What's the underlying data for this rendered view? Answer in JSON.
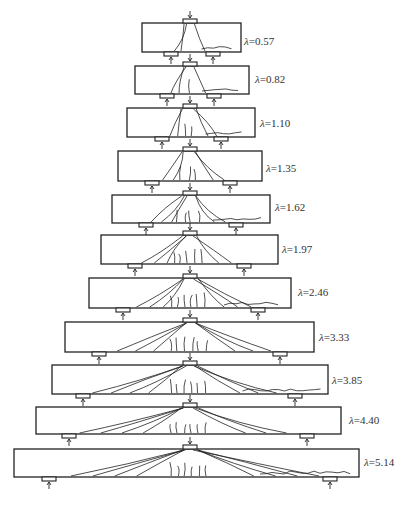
{
  "figure": {
    "symbol": "λ",
    "beams": [
      {
        "label": "=0.57",
        "x1": 142,
        "x2": 241,
        "top": 23,
        "bottom": 52,
        "sl": 171,
        "sr": 213,
        "lx": 244,
        "ly": 35
      },
      {
        "label": "=0.82",
        "x1": 135,
        "x2": 249,
        "top": 66,
        "bottom": 94,
        "sl": 167,
        "sr": 214,
        "lx": 255,
        "ly": 73
      },
      {
        "label": "=1.10",
        "x1": 127,
        "x2": 255,
        "top": 108,
        "bottom": 137,
        "sl": 162,
        "sr": 221,
        "lx": 260,
        "ly": 117
      },
      {
        "label": "=1.35",
        "x1": 118,
        "x2": 262,
        "top": 151,
        "bottom": 181,
        "sl": 152,
        "sr": 230,
        "lx": 266,
        "ly": 162
      },
      {
        "label": "=1.62",
        "x1": 112,
        "x2": 270,
        "top": 195,
        "bottom": 223,
        "sl": 146,
        "sr": 236,
        "lx": 275,
        "ly": 201
      },
      {
        "label": "=1.97",
        "x1": 101,
        "x2": 278,
        "top": 235,
        "bottom": 264,
        "sl": 135,
        "sr": 244,
        "lx": 282,
        "ly": 243
      },
      {
        "label": "=2.46",
        "x1": 89,
        "x2": 291,
        "top": 278,
        "bottom": 308,
        "sl": 123,
        "sr": 258,
        "lx": 298,
        "ly": 286
      },
      {
        "label": "=3.33",
        "x1": 65,
        "x2": 314,
        "top": 322,
        "bottom": 352,
        "sl": 99,
        "sr": 280,
        "lx": 319,
        "ly": 331
      },
      {
        "label": "=3.85",
        "x1": 52,
        "x2": 328,
        "top": 365,
        "bottom": 394,
        "sl": 83,
        "sr": 295,
        "lx": 332,
        "ly": 374
      },
      {
        "label": "=4.40",
        "x1": 36,
        "x2": 341,
        "top": 407,
        "bottom": 434,
        "sl": 69,
        "sr": 307,
        "lx": 349,
        "ly": 414
      },
      {
        "label": "=5.14",
        "x1": 14,
        "x2": 359,
        "top": 449,
        "bottom": 477,
        "sl": 49,
        "sr": 330,
        "lx": 364,
        "ly": 456
      }
    ],
    "load_x": 190
  }
}
